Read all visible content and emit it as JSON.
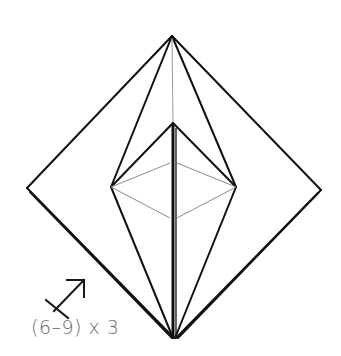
{
  "diagram": {
    "instruction_icon": "repeat-turn-arrow-icon",
    "step_label": "(6–9) x 3",
    "colors": {
      "line": "#111111",
      "fold_line": "#8a8a8a",
      "text": "#6b6b6b",
      "background": "#ffffff"
    },
    "points": {
      "top": [
        172,
        36
      ],
      "left": [
        27,
        188
      ],
      "right": [
        321,
        190
      ],
      "bottom": [
        174,
        338
      ],
      "inner_top": [
        173,
        123
      ],
      "inner_left": [
        111,
        187
      ],
      "inner_right": [
        236,
        187
      ],
      "gray_top": [
        171,
        163
      ],
      "gray_bottom": [
        171,
        218
      ]
    }
  }
}
